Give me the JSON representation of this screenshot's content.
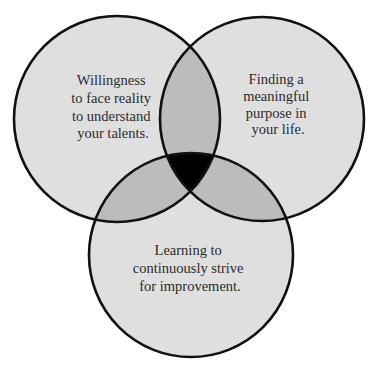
{
  "diagram": {
    "type": "venn-3",
    "colors": {
      "single": "#dfdfdf",
      "pair": "#bcbcbc",
      "triple": "#000000",
      "stroke": "#111111",
      "text": "#2b2b2b",
      "background": "#ffffff"
    },
    "circles": [
      {
        "id": "left",
        "lines": [
          "Willingness",
          "to face reality",
          "to understand",
          "your talents."
        ]
      },
      {
        "id": "right",
        "lines": [
          "Finding a",
          "meaningful",
          "purpose in",
          "your life."
        ]
      },
      {
        "id": "bottom",
        "lines": [
          "Learning to",
          "continuously strive",
          "for improvement."
        ]
      }
    ]
  }
}
